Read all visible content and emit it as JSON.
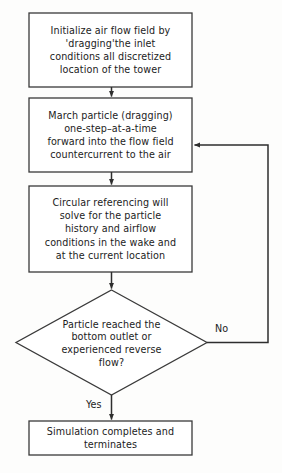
{
  "diagram": {
    "type": "flowchart",
    "colors": {
      "background": "#fdfdfc",
      "stroke": "#3a3a3a",
      "text": "#1c1c1c"
    },
    "nodes": [
      {
        "id": "proc1",
        "shape": "process",
        "text": "Initialize air flow field by\n'dragging'the inlet\nconditions all discretized\nlocation of the tower"
      },
      {
        "id": "proc2",
        "shape": "process",
        "text": "March particle (dragging)\none-step–at-a-time\nforward into the flow field\ncountercurrent to the air"
      },
      {
        "id": "proc3",
        "shape": "process",
        "text": "Circular referencing will\nsolve for the particle\nhistory and airflow\nconditions in the wake and\nat the current location"
      },
      {
        "id": "dec1",
        "shape": "decision",
        "text": "Particle reached the\nbottom outlet or\nexperienced reverse\nflow?"
      },
      {
        "id": "proc4",
        "shape": "process",
        "text": "Simulation completes and\nterminates"
      }
    ],
    "edges": [
      {
        "id": "e1",
        "from": "proc1",
        "to": "proc2",
        "label": ""
      },
      {
        "id": "e2",
        "from": "proc2",
        "to": "proc3",
        "label": ""
      },
      {
        "id": "e3",
        "from": "proc3",
        "to": "dec1",
        "label": ""
      },
      {
        "id": "e4",
        "from": "dec1",
        "to": "proc2",
        "label": "No"
      },
      {
        "id": "e5",
        "from": "dec1",
        "to": "proc4",
        "label": "Yes"
      }
    ]
  }
}
